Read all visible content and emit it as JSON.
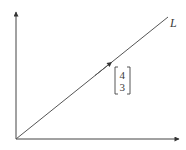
{
  "diagram": {
    "line_label": "L",
    "direction_vector": {
      "top": "4",
      "bottom": "3"
    },
    "colors": {
      "stroke": "#444444",
      "text": "#3a3a3a",
      "background": "#ffffff"
    }
  }
}
